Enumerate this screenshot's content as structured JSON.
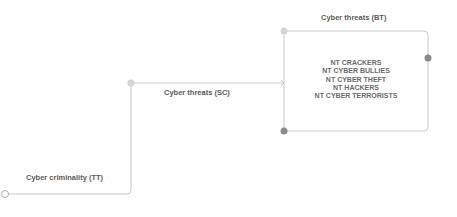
{
  "diagram": {
    "type": "hierarchy-tree",
    "nodes": {
      "tt": {
        "label": "Cyber criminality (TT)"
      },
      "sc": {
        "label": "Cyber threats (SC)"
      },
      "bt": {
        "label": "Cyber threats (BT)"
      }
    },
    "narrower_terms": [
      "NT CRACKERS",
      "NT CYBER BULLIES",
      "NT CYBER THEFT",
      "NT HACKERS",
      "NT CYBER TERRORISTS"
    ],
    "colors": {
      "line": "#c8c8c8",
      "node_light": "#d4d4d4",
      "node_dark": "#8a8a8a",
      "text": "#5a5a5a"
    }
  }
}
